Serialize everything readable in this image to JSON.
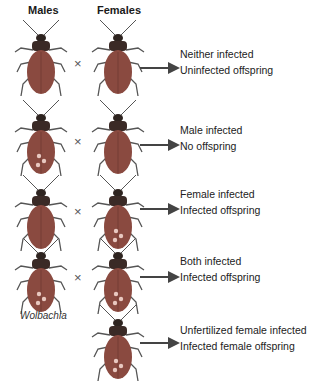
{
  "headers": {
    "males": "Males",
    "females": "Females"
  },
  "cross_symbol": "×",
  "label_wolbachia": "Wolbachia",
  "colors": {
    "body": "#8a4a40",
    "head": "#3a2a26",
    "spot": "#e8c8c0",
    "leg": "#555555",
    "arrow": "#444444"
  },
  "rows": [
    {
      "male_infected": false,
      "female_infected": false,
      "line1": "Neither infected",
      "line2": "Uninfected offspring"
    },
    {
      "male_infected": true,
      "female_infected": false,
      "line1": "Male infected",
      "line2": "No offspring"
    },
    {
      "male_infected": false,
      "female_infected": true,
      "line1": "Female infected",
      "line2": "Infected offspring"
    },
    {
      "male_infected": true,
      "female_infected": true,
      "line1": "Both infected",
      "line2": "Infected offspring"
    },
    {
      "male_infected": null,
      "female_infected": true,
      "line1": "Unfertilized female infected",
      "line2": "Infected female offspring"
    }
  ]
}
